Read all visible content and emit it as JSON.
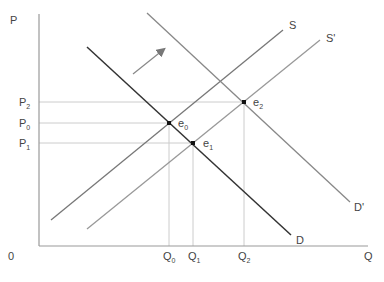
{
  "diagram": {
    "type": "supply-demand",
    "axes": {
      "y_label": "P",
      "x_label": "Q",
      "origin_label": "0"
    },
    "price_labels": [
      {
        "main": "P",
        "sub": "2",
        "y": 102
      },
      {
        "main": "P",
        "sub": "0",
        "y": 123
      },
      {
        "main": "P",
        "sub": "1",
        "y": 143
      }
    ],
    "quantity_labels": [
      {
        "main": "Q",
        "sub": "0",
        "x": 169
      },
      {
        "main": "Q",
        "sub": "1",
        "x": 193
      },
      {
        "main": "Q",
        "sub": "2",
        "x": 244
      }
    ],
    "curves": [
      {
        "name": "S",
        "label": "S",
        "color": "#777777"
      },
      {
        "name": "S'",
        "label": "S'",
        "color": "#999999"
      },
      {
        "name": "D",
        "label": "D",
        "color": "#333333"
      },
      {
        "name": "D'",
        "label": "D'",
        "color": "#888888"
      }
    ],
    "equilibria": [
      {
        "main": "e",
        "sub": "0"
      },
      {
        "main": "e",
        "sub": "1"
      },
      {
        "main": "e",
        "sub": "2"
      }
    ],
    "shift_arrow": {
      "direction": "up-right",
      "color": "#888888"
    }
  }
}
